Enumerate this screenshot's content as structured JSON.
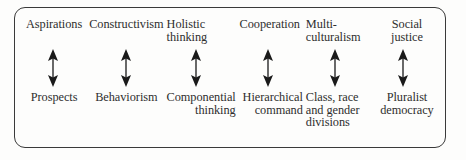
{
  "figure": {
    "frame_shape": "rounded-rectangle",
    "border_color": "#3a3a3a",
    "background_color": "#fdfdfc",
    "text_color": "#2e2e2e",
    "arrow_color": "#1a1a1a",
    "connector_icon": "double-headed-vertical-arrow",
    "columns": [
      {
        "top_label": "Aspirations",
        "top_align": "center",
        "bottom_label": "Prospects",
        "bottom_align": "center"
      },
      {
        "top_label": "Constructivism",
        "top_align": "center",
        "bottom_label": "Behaviorism",
        "bottom_align": "center"
      },
      {
        "top_label": "Holistic\nthinking",
        "top_align": "left",
        "bottom_label": "Componential\nthinking",
        "bottom_align": "right"
      },
      {
        "top_label": "Cooperation",
        "top_align": "center",
        "bottom_label": "Hierarchical\ncommand",
        "bottom_align": "right"
      },
      {
        "top_label": "Multi-\nculturalism",
        "top_align": "left",
        "bottom_label": "Class, race\nand gender\ndivisions",
        "bottom_align": "left"
      },
      {
        "top_label": "Social\njustice",
        "top_align": "center",
        "bottom_label": "Pluralist\ndemocracy",
        "bottom_align": "center"
      }
    ]
  }
}
